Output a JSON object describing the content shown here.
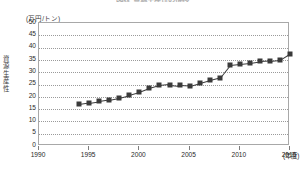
{
  "figure": {
    "title": "図表 資源生産性の推移",
    "y_unit_label": "(万円/トン)",
    "y_axis_title": "資源生産性",
    "x_unit_label": "(年度)"
  },
  "chart_data": {
    "type": "line",
    "title": "図表 資源生産性の推移",
    "xlabel": "(年度)",
    "ylabel": "資源生産性",
    "yunit": "(万円/トン)",
    "xlim": [
      1990,
      2015
    ],
    "ylim": [
      0,
      50
    ],
    "ytick_labels": [
      "0",
      "5",
      "10",
      "15",
      "20",
      "25",
      "30",
      "35",
      "40",
      "45",
      "50"
    ],
    "ytick_values": [
      0,
      5,
      10,
      15,
      20,
      25,
      30,
      35,
      40,
      45,
      50
    ],
    "xtick_labels": [
      "1990",
      "1995",
      "2000",
      "2005",
      "2010",
      "2015"
    ],
    "xtick_values": [
      1990,
      1995,
      2000,
      2005,
      2010,
      2015
    ],
    "grid": "horizontal-dotted",
    "legend": "none",
    "marker": "square",
    "series_color": "#3a3a3a",
    "series": [
      {
        "name": "資源生産性",
        "x": [
          1994,
          1995,
          1996,
          1997,
          1998,
          1999,
          2000,
          2001,
          2002,
          2003,
          2004,
          2005,
          2006,
          2007,
          2008,
          2009,
          2010,
          2011,
          2012,
          2013,
          2014,
          2015
        ],
        "values": [
          17.0,
          17.6,
          18.2,
          18.8,
          19.6,
          20.6,
          21.8,
          23.4,
          24.6,
          25.0,
          24.6,
          24.4,
          25.6,
          26.8,
          27.8,
          33.0,
          33.4,
          33.8,
          34.4,
          34.6,
          35.0,
          37.6
        ]
      }
    ]
  }
}
